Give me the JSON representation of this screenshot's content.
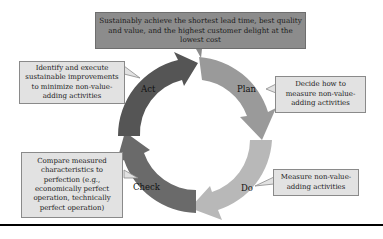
{
  "goal": {
    "text": "Sustainably achieve the shortest lead time, best quality and value, and the highest customer delight at the lowest cost"
  },
  "cycle": {
    "steps": [
      {
        "label": "Plan",
        "description": "Decide how to measure non-value-adding activities",
        "color": "#9a9a9a"
      },
      {
        "label": "Do",
        "description": "Measure non-value-adding activities",
        "color": "#b8b8b8"
      },
      {
        "label": "Check",
        "description": "Compare measured characteristics to perfection (e.g., economically perfect operation, technically perfect operation)",
        "color": "#6a6a6a"
      },
      {
        "label": "Act",
        "description": "Identify and execute sustainable improvements to minimize non-value-adding activities",
        "color": "#555555"
      }
    ]
  },
  "colors": {
    "goal_box": "#8c8c8c",
    "callout_box": "#e2e2e2"
  }
}
